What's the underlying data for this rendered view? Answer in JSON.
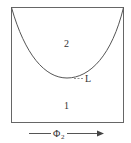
{
  "diagram": {
    "regions": [
      {
        "id": "region-2",
        "label": "2"
      },
      {
        "id": "region-1",
        "label": "1"
      }
    ],
    "curve_label": "L",
    "axis": {
      "symbol": "Φ",
      "subscript": "2"
    },
    "colors": {
      "line": "#555555",
      "text": "#333333",
      "background": "#ffffff"
    }
  }
}
